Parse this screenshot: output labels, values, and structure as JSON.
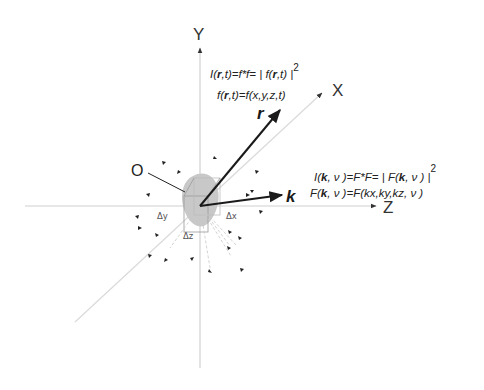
{
  "diagram": {
    "axes": {
      "y_label": "Y",
      "x_label": "X",
      "z_label": "Z",
      "axis_color": "#cfcfcf"
    },
    "origin": {
      "label": "O",
      "blob_color": "#c8c8c8"
    },
    "voxel": {
      "dx_label": "Δx",
      "dy_label": "Δy",
      "dz_label": "Δz"
    },
    "vectors": {
      "r": {
        "label": "r",
        "color": "#1a1a1a"
      },
      "k": {
        "label": "k",
        "color": "#1a1a1a"
      }
    },
    "real_space_formulas": {
      "line1": {
        "prefix": "I(",
        "bold_var": "r",
        "mid": ",t)=f*f= | f(",
        "bold_var2": "r",
        "suffix": ",t) |",
        "exponent": "2"
      },
      "line2": {
        "prefix": "f(",
        "bold_var": "r",
        "suffix": ",t)=f(x,y,z,t)"
      }
    },
    "reciprocal_space_formulas": {
      "line1": {
        "prefix": "I(",
        "bold_var": "k",
        "mid": ", ν )=F*F= | F(",
        "bold_var2": "k",
        "suffix": ", ν ) |",
        "exponent": "2"
      },
      "line2": {
        "prefix": "F(",
        "bold_var": "k",
        "suffix": ", ν )=F(kx,ky,kz, ν )"
      }
    },
    "scatter_arrows_color": "#222222"
  }
}
